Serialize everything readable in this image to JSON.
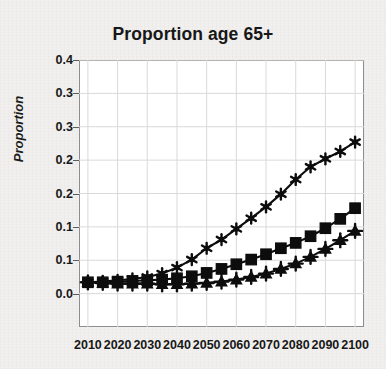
{
  "chart_data": {
    "type": "line",
    "title": "Proportion age 65+",
    "xlabel": "",
    "ylabel": "Proportion",
    "x": [
      2010,
      2015,
      2020,
      2025,
      2030,
      2035,
      2040,
      2045,
      2050,
      2055,
      2060,
      2065,
      2070,
      2075,
      2080,
      2085,
      2090,
      2095,
      2100
    ],
    "xtick_labels": [
      "2010",
      "2020",
      "2030",
      "2040",
      "2050",
      "2060",
      "2070",
      "2080",
      "2090",
      "2100"
    ],
    "xticks": [
      2010,
      2020,
      2030,
      2040,
      2050,
      2060,
      2070,
      2080,
      2090,
      2100
    ],
    "ytick_labels": [
      "0.4",
      "0.3",
      "0.3",
      "0.2",
      "0.2",
      "0.1",
      "0.1",
      "0.0"
    ],
    "yticks": [
      0.4,
      0.35,
      0.3,
      0.25,
      0.2,
      0.15,
      0.1,
      0.05,
      0.0
    ],
    "xlim": [
      2007,
      2103
    ],
    "ylim": [
      0.0,
      0.4
    ],
    "grid": true,
    "legend": "none",
    "series": [
      {
        "name": "series-star",
        "marker": "star",
        "values": [
          0.067,
          0.068,
          0.07,
          0.072,
          0.075,
          0.08,
          0.089,
          0.101,
          0.118,
          0.131,
          0.147,
          0.163,
          0.18,
          0.199,
          0.221,
          0.24,
          0.252,
          0.263,
          0.277
        ]
      },
      {
        "name": "series-square",
        "marker": "square",
        "values": [
          0.067,
          0.067,
          0.068,
          0.069,
          0.07,
          0.071,
          0.073,
          0.076,
          0.081,
          0.087,
          0.094,
          0.101,
          0.109,
          0.118,
          0.126,
          0.136,
          0.148,
          0.162,
          0.178
        ]
      },
      {
        "name": "series-triangle",
        "marker": "triangle-plus",
        "values": [
          0.067,
          0.066,
          0.065,
          0.065,
          0.065,
          0.064,
          0.064,
          0.065,
          0.066,
          0.068,
          0.071,
          0.075,
          0.08,
          0.087,
          0.095,
          0.105,
          0.117,
          0.13,
          0.144
        ]
      }
    ]
  },
  "colors": {
    "background": "#f1f0ee",
    "plot_background": "#ffffff",
    "ink": "#0d0d0d",
    "gridline": "#d9d9d9",
    "axis": "#8d8d8d"
  }
}
